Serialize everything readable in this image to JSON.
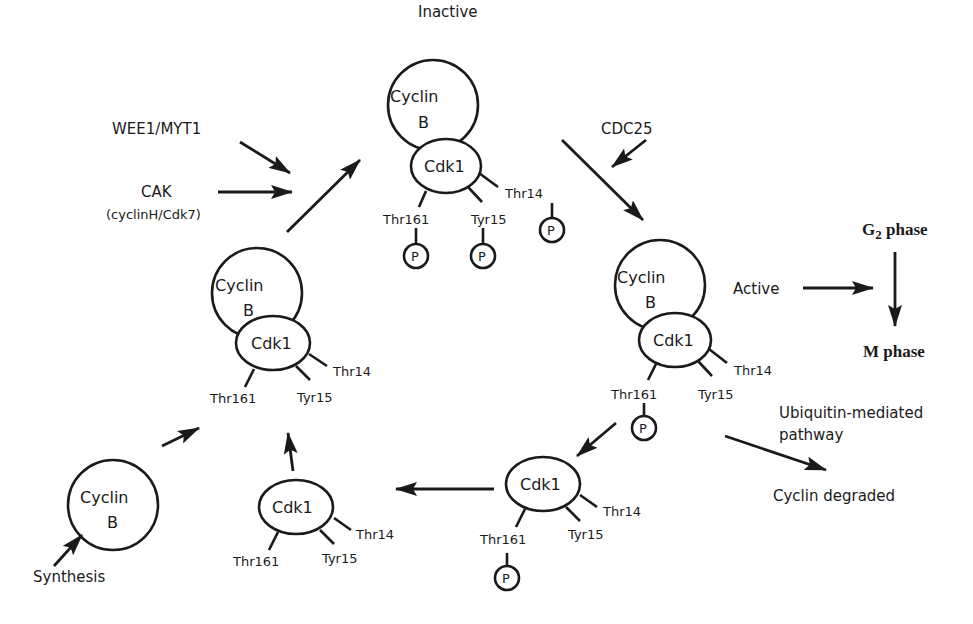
{
  "labels": {
    "inactive": "Inactive",
    "active": "Active",
    "wee1": "WEE1/MYT1",
    "cak": "CAK",
    "cak_sub": "(cyclinH/Cdk7)",
    "cdc25": "CDC25",
    "g2_prefix": "G",
    "g2_sub": "2",
    "g2_suffix": " phase",
    "m_phase": "M phase",
    "ubiquitin_line1": "Ubiquitin-mediated",
    "ubiquitin_line2": "pathway",
    "cyclin_degraded": "Cyclin degraded",
    "synthesis": "Synthesis"
  },
  "molecules": {
    "cyclin_line1": "Cyclin",
    "cyclin_line2": "B",
    "cdk": "Cdk1",
    "phospho": "P"
  },
  "residues": {
    "thr161": "Thr161",
    "tyr15": "Tyr15",
    "thr14": "Thr14"
  },
  "complexes": [
    {
      "id": "inactive-complex",
      "state": "Inactive",
      "cyclin": true,
      "phosphorylated": [
        "Thr161",
        "Tyr15",
        "Thr14"
      ]
    },
    {
      "id": "active-complex",
      "state": "Active",
      "cyclin": true,
      "phosphorylated": [
        "Thr161"
      ]
    },
    {
      "id": "precursor-complex",
      "state": "Unphosphorylated",
      "cyclin": true,
      "phosphorylated": []
    },
    {
      "id": "free-cdk1-phospho",
      "state": "Cyclin degraded",
      "cyclin": false,
      "phosphorylated": [
        "Thr161"
      ]
    },
    {
      "id": "free-cdk1",
      "state": "Dephosphorylated",
      "cyclin": false,
      "phosphorylated": []
    },
    {
      "id": "free-cyclin-b",
      "state": "Synthesized",
      "cyclin": true,
      "phosphorylated": []
    }
  ]
}
